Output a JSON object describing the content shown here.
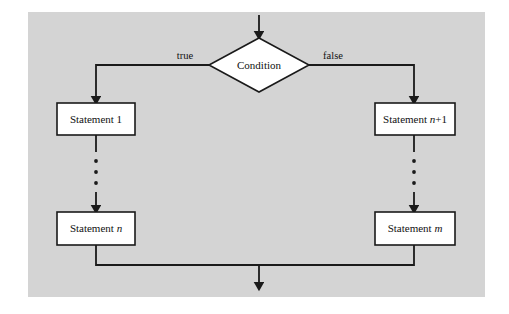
{
  "figure": {
    "background_color": "#ffffff",
    "panel_color": "#d4d4d4",
    "line_color": "#1a1a1a",
    "shape_fill": "#ffffff"
  },
  "nodes": {
    "condition": {
      "label": "Condition",
      "shape": "diamond"
    },
    "statement_1": {
      "label": "Statement 1",
      "shape": "rectangle"
    },
    "statement_n": {
      "label_prefix": "Statement ",
      "label_var": "n",
      "shape": "rectangle"
    },
    "statement_n_plus_1": {
      "label_prefix": "Statement ",
      "label_var": "n",
      "label_suffix": "+1",
      "shape": "rectangle"
    },
    "statement_m": {
      "label_prefix": "Statement ",
      "label_var": "m",
      "shape": "rectangle"
    }
  },
  "edges": {
    "true_label": "true",
    "false_label": "false"
  },
  "ellipsis": {
    "dot_count": 3
  }
}
